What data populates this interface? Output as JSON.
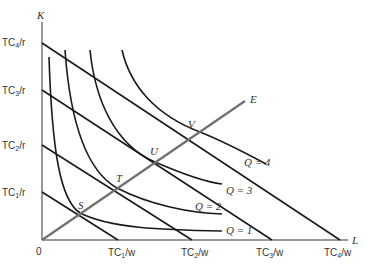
{
  "diagram": {
    "type": "isoquant-isocost expansion path",
    "axes": {
      "y_label": "K",
      "x_label": "L",
      "origin_label": "0"
    },
    "isocost_lines": [
      {
        "name": "TC1",
        "k_intercept_label": "TC",
        "k_sub": "1",
        "k_suffix": "/r",
        "l_intercept_label": "TC",
        "l_sub": "1",
        "l_suffix": "/w"
      },
      {
        "name": "TC2",
        "k_intercept_label": "TC",
        "k_sub": "2",
        "k_suffix": "/r",
        "l_intercept_label": "TC",
        "l_sub": "2",
        "l_suffix": "/w"
      },
      {
        "name": "TC3",
        "k_intercept_label": "TC",
        "k_sub": "3",
        "k_suffix": "/r",
        "l_intercept_label": "TC",
        "l_sub": "3",
        "l_suffix": "/w"
      },
      {
        "name": "TC4",
        "k_intercept_label": "TC",
        "k_sub": "4",
        "k_suffix": "/r",
        "l_intercept_label": "TC",
        "l_sub": "4",
        "l_suffix": "/w"
      }
    ],
    "isoquants": [
      {
        "label": "Q = 1"
      },
      {
        "label": "Q = 2"
      },
      {
        "label": "Q = 3"
      },
      {
        "label": "Q = 4"
      }
    ],
    "tangency_points": [
      "S",
      "T",
      "U",
      "V"
    ],
    "expansion_path_label": "E",
    "colors": {
      "lines": "#1a1a1a",
      "axes": "#999999",
      "expansion_path": "#707070",
      "text": "#333333"
    }
  }
}
